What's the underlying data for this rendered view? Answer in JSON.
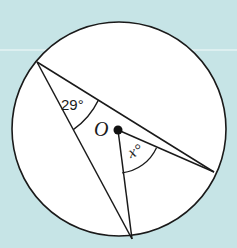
{
  "diagram": {
    "title": "",
    "type": "circle-geometry",
    "colors": {
      "background": "#c6e4e6",
      "circle_fill": "#ffffff",
      "stroke": "#1a1a1a"
    },
    "circle": {
      "center_label": "O",
      "cx": 119,
      "cy": 129,
      "r": 107
    },
    "points": {
      "A": {
        "x": 37,
        "y": 62
      },
      "B": {
        "x": 214,
        "y": 172
      },
      "C": {
        "x": 132,
        "y": 239
      },
      "O": {
        "x": 118,
        "y": 130
      }
    },
    "segments": [
      {
        "from": "A",
        "to": "B"
      },
      {
        "from": "A",
        "to": "C"
      },
      {
        "from": "O",
        "to": "B"
      },
      {
        "from": "O",
        "to": "C"
      }
    ],
    "labels": {
      "angle_at_A": "29°",
      "angle_at_O": "x°",
      "center": "O"
    }
  }
}
